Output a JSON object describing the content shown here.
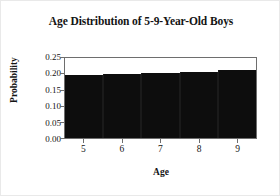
{
  "chart_data": {
    "type": "bar",
    "title": "Age Distribution of 5-9-Year-Old Boys",
    "xlabel": "Age",
    "ylabel": "Probability",
    "categories": [
      "5",
      "6",
      "7",
      "8",
      "9"
    ],
    "values": [
      0.196,
      0.199,
      0.204,
      0.206,
      0.212
    ],
    "ylim": [
      0.0,
      0.25
    ],
    "ytick_labels": [
      "0.00",
      "0.05",
      "0.10",
      "0.15",
      "0.20",
      "0.25"
    ],
    "ytick_values": [
      0.0,
      0.05,
      0.1,
      0.15,
      0.2,
      0.25
    ],
    "xtick_labels": [
      "5",
      "6",
      "7",
      "8",
      "9"
    ],
    "grid": false,
    "legend": false,
    "bar_color": "#0d0d0d",
    "frame_color": "#6e6e6e",
    "background": "#ffffff"
  }
}
